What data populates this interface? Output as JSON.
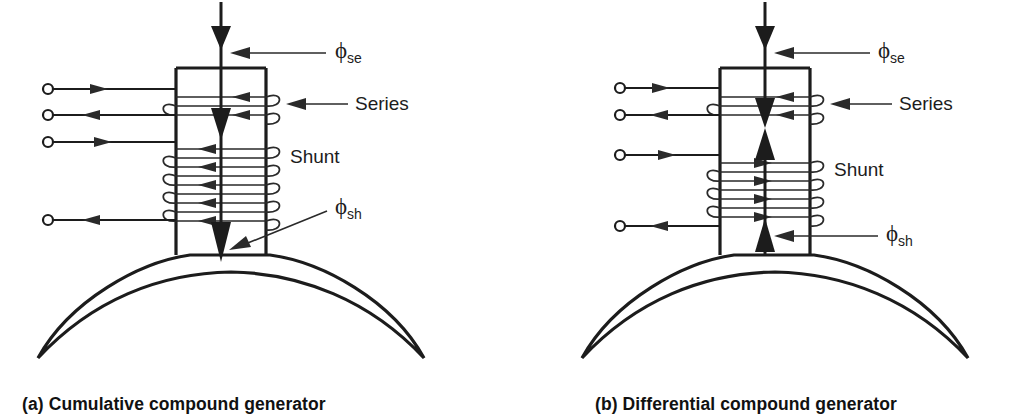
{
  "figure": {
    "background_color": "#ffffff",
    "line_color": "#1c1c1c"
  },
  "panels": [
    {
      "id": "a",
      "caption": "(a) Cumulative compound generator",
      "labels": {
        "series": "Series",
        "shunt": "Shunt",
        "phi_se_symbol": "ϕ",
        "phi_se_sub": "se",
        "phi_sh_symbol": "ϕ",
        "phi_sh_sub": "sh"
      },
      "flux": {
        "series_flux_direction": "down",
        "shunt_flux_direction": "down",
        "relationship": "aiding"
      },
      "series_coil": {
        "turns": 2,
        "current_arrow_direction": "left"
      },
      "shunt_coil": {
        "turns": 5,
        "current_arrow_direction": "left"
      },
      "terminals": [
        {
          "y": 89,
          "lead_arrow_direction": "right"
        },
        {
          "y": 115,
          "lead_arrow_direction": "left"
        },
        {
          "y": 142,
          "lead_arrow_direction": "right"
        },
        {
          "y": 220,
          "lead_arrow_direction": "left"
        }
      ]
    },
    {
      "id": "b",
      "caption": "(b) Differential compound generator",
      "labels": {
        "series": "Series",
        "shunt": "Shunt",
        "phi_se_symbol": "ϕ",
        "phi_se_sub": "se",
        "phi_sh_symbol": "ϕ",
        "phi_sh_sub": "sh"
      },
      "flux": {
        "series_flux_direction": "down",
        "shunt_flux_direction": "up",
        "relationship": "opposing"
      },
      "series_coil": {
        "turns": 2,
        "current_arrow_direction": "left"
      },
      "shunt_coil": {
        "turns": 4,
        "current_arrow_direction": "right"
      },
      "terminals": [
        {
          "y": 88,
          "lead_arrow_direction": "right"
        },
        {
          "y": 115,
          "lead_arrow_direction": "left"
        },
        {
          "y": 155,
          "lead_arrow_direction": "right"
        },
        {
          "y": 226,
          "lead_arrow_direction": "left"
        }
      ]
    }
  ]
}
